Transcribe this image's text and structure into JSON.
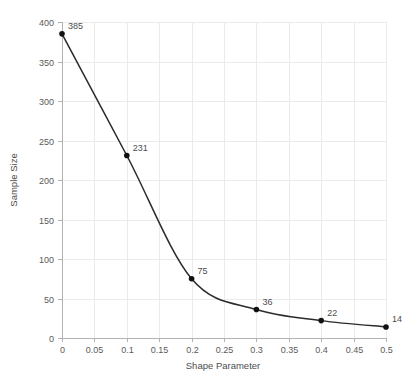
{
  "chart_data": {
    "type": "line",
    "title": "",
    "xlabel": "Shape Parameter",
    "ylabel": "Sample Size",
    "x": [
      0,
      0.1,
      0.2,
      0.3,
      0.4,
      0.5
    ],
    "values": [
      385,
      231,
      75,
      36,
      22,
      14
    ],
    "point_labels": [
      "385",
      "231",
      "75",
      "36",
      "22",
      "14"
    ],
    "xlim": [
      0,
      0.5
    ],
    "ylim": [
      0,
      400
    ],
    "xticks": [
      0,
      0.05,
      0.1,
      0.15,
      0.2,
      0.25,
      0.3,
      0.35,
      0.4,
      0.45,
      0.5
    ],
    "xtick_labels": [
      "0",
      "0.05",
      "0.1",
      "0.15",
      "0.2",
      "0.25",
      "0.3",
      "0.35",
      "0.4",
      "0.45",
      "0.5"
    ],
    "yticks": [
      0,
      50,
      100,
      150,
      200,
      250,
      300,
      350,
      400
    ],
    "ytick_labels": [
      "0",
      "50",
      "100",
      "150",
      "200",
      "250",
      "300",
      "350",
      "400"
    ],
    "grid": true,
    "legend": null,
    "legend_position": "none",
    "marker": "circle",
    "line_color": "#2b2b2b",
    "marker_color": "#111111",
    "grid_color": "#ebebeb",
    "axis_color": "#b3b3b3",
    "text_color": "#4d4d4d",
    "background_color": "#ffffff"
  }
}
